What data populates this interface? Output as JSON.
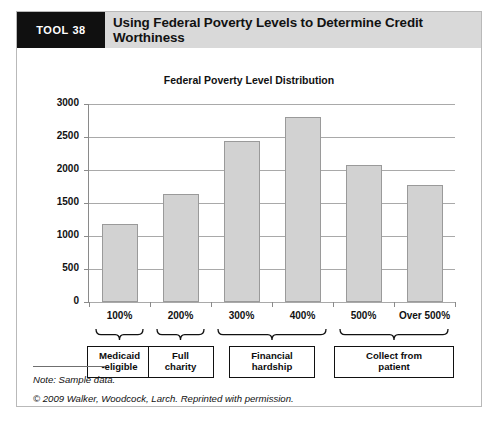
{
  "header": {
    "tool_badge": "TOOL 38",
    "title": "Using Federal Poverty Levels to Determine Credit Worthiness",
    "badge_bg": "#101010",
    "band_bg": "#d9d9d9"
  },
  "chart_data": {
    "type": "bar",
    "title": "Federal Poverty Level Distribution",
    "xlabel": "",
    "ylabel": "Patients",
    "categories": [
      "100%",
      "200%",
      "300%",
      "400%",
      "500%",
      "Over 500%"
    ],
    "values": [
      1180,
      1640,
      2440,
      2800,
      2075,
      1780
    ],
    "ylim": [
      0,
      3000
    ],
    "yticks": [
      0,
      500,
      1000,
      1500,
      2000,
      2500,
      3000
    ],
    "ytick_labels": [
      "0",
      "500",
      "1000",
      "1500",
      "2000",
      "2500",
      "3000"
    ],
    "grid": true,
    "legend": "none",
    "bar_fill": "#d2d2d2",
    "bar_border": "#9a9a9a"
  },
  "groups": [
    {
      "label": "Medicaid\n-eligible",
      "line1": "Medicaid",
      "line2": "-eligible",
      "spans": [
        "100%"
      ]
    },
    {
      "label": "Full charity",
      "line1": "Full",
      "line2": "charity",
      "spans": [
        "200%"
      ]
    },
    {
      "label": "Financial hardship",
      "line1": "Financial",
      "line2": "hardship",
      "spans": [
        "300%",
        "400%"
      ]
    },
    {
      "label": "Collect from patient",
      "line1": "Collect from",
      "line2": "patient",
      "spans": [
        "500%",
        "Over 500%"
      ]
    }
  ],
  "footer": {
    "note": "Note: Sample data.",
    "copyright": "© 2009 Walker, Woodcock, Larch. Reprinted with permission."
  }
}
